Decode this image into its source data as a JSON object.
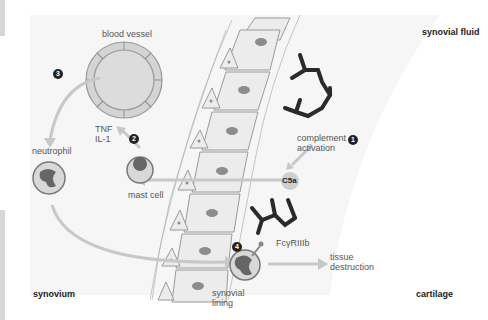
{
  "diagram": {
    "regions": {
      "synovial_fluid": "synovial fluid",
      "synovium": "synovium",
      "cartilage": "cartilage",
      "synovial_lining": [
        "synovial",
        "lining"
      ]
    },
    "labels": {
      "blood_vessel": "blood vessel",
      "tnf": "TNF",
      "il1": "IL-1",
      "neutrophil": "neutrophil",
      "mast_cell": "mast cell",
      "complement_activation": [
        "complement",
        "activation"
      ],
      "c5a": "C5a",
      "fc_receptor": "FcγRIIIb",
      "tissue_destruction": [
        "tissue",
        "destruction"
      ]
    },
    "steps": [
      {
        "number": "1",
        "label": "complement activation"
      },
      {
        "number": "2",
        "label": "TNF / IL-1 release by mast cell"
      },
      {
        "number": "3",
        "label": "neutrophil recruitment from blood vessel"
      },
      {
        "number": "4",
        "label": "neutrophil binds immune complex via FcγRIIIb"
      }
    ],
    "colors": {
      "cell_fill": "#ececec",
      "cell_stroke": "#9a9a9a",
      "nucleus": "#8c8c8c",
      "vessel_fill": "#d4d4d4",
      "arrow": "#c8c8c8",
      "immune_complex": "#2a2a2a",
      "fluid_bg": "#f4f4f4"
    }
  }
}
